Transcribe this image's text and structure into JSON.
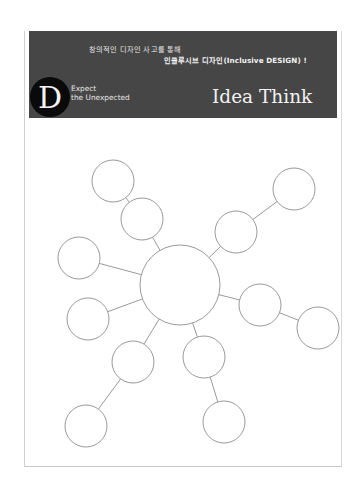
{
  "header": {
    "tagline_line1": "창의적인 디자인 사고를 통해",
    "tagline_line2": "인클루시브 디자인(Inclusive DESIGN) !",
    "logo_letter": "D",
    "motto_line1": "Expect",
    "motto_line2": "the Unexpected",
    "title": "Idea Think",
    "background_color": "#464646",
    "logo_color": "#0a0a0a"
  },
  "mindmap": {
    "description": "Blank mind map worksheet: one large central circle with empty satellite circles connected by lines",
    "stroke_color": "#9a9a9a",
    "center": {
      "id": "center",
      "cx": 180,
      "cy": 285,
      "r": 40
    },
    "nodes": [
      {
        "id": "n-upper-left-inner",
        "cx": 142,
        "cy": 219,
        "r": 21,
        "parent": "center"
      },
      {
        "id": "n-upper-left-outer",
        "cx": 113,
        "cy": 181,
        "r": 21,
        "parent": "n-upper-left-inner"
      },
      {
        "id": "n-upper-right-inner",
        "cx": 236,
        "cy": 232,
        "r": 21,
        "parent": "center"
      },
      {
        "id": "n-upper-right-outer",
        "cx": 294,
        "cy": 189,
        "r": 21,
        "parent": "n-upper-right-inner"
      },
      {
        "id": "n-left",
        "cx": 79,
        "cy": 258,
        "r": 21,
        "parent": "center"
      },
      {
        "id": "n-lower-left",
        "cx": 88,
        "cy": 319,
        "r": 21,
        "parent": "center"
      },
      {
        "id": "n-right-inner",
        "cx": 260,
        "cy": 305,
        "r": 21,
        "parent": "center"
      },
      {
        "id": "n-right-outer",
        "cx": 318,
        "cy": 328,
        "r": 21,
        "parent": "n-right-inner"
      },
      {
        "id": "n-bottom-left-inner",
        "cx": 133,
        "cy": 362,
        "r": 21,
        "parent": "center"
      },
      {
        "id": "n-bottom-left-outer",
        "cx": 86,
        "cy": 426,
        "r": 21,
        "parent": "n-bottom-left-inner"
      },
      {
        "id": "n-bottom-right-inner",
        "cx": 204,
        "cy": 357,
        "r": 21,
        "parent": "center"
      },
      {
        "id": "n-bottom-right-outer",
        "cx": 224,
        "cy": 422,
        "r": 21,
        "parent": "n-bottom-right-inner"
      }
    ]
  }
}
